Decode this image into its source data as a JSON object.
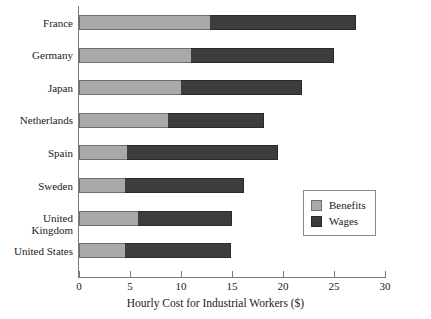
{
  "chart_data": {
    "type": "bar",
    "orientation": "horizontal",
    "stacked": true,
    "title": "",
    "xlabel": "Hourly Cost for Industrial Workers ($)",
    "ylabel": "",
    "xlim": [
      0,
      30
    ],
    "xticks": [
      0,
      5,
      10,
      15,
      20,
      25,
      30
    ],
    "xtick_labels": [
      "0",
      "5",
      "10",
      "15",
      "20",
      "25",
      "30"
    ],
    "grid": false,
    "legend_position": "lower-right-inside",
    "categories": [
      "France",
      "Germany",
      "Japan",
      "Netherlands",
      "Spain",
      "Sweden",
      "United Kingdom",
      "United States"
    ],
    "series": [
      {
        "name": "Benefits",
        "color": "#a9a9a9",
        "values": [
          12.8,
          11.0,
          10.0,
          8.7,
          4.7,
          4.5,
          5.8,
          4.5
        ]
      },
      {
        "name": "Wages",
        "color": "#3d3d3d",
        "values": [
          14.4,
          14.0,
          11.9,
          9.4,
          14.8,
          11.7,
          9.2,
          10.4
        ]
      }
    ],
    "totals": [
      27.2,
      25.0,
      21.9,
      18.1,
      19.5,
      16.2,
      15.0,
      14.9
    ]
  },
  "legend": {
    "items": [
      {
        "label": "Benefits",
        "swatch": "benefits"
      },
      {
        "label": "Wages",
        "swatch": "wages"
      }
    ]
  }
}
